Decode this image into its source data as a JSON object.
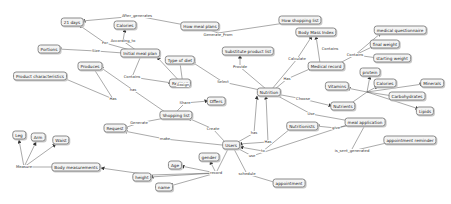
{
  "diagram": {
    "type": "concept-map",
    "nodes": [
      {
        "id": "21days",
        "label": "21 days",
        "x": 72,
        "y": 22
      },
      {
        "id": "howmeal",
        "label": "How meal plans",
        "x": 200,
        "y": 26
      },
      {
        "id": "howshop",
        "label": "How shopping list",
        "x": 300,
        "y": 20
      },
      {
        "id": "calories1",
        "label": "Calories",
        "x": 125,
        "y": 25
      },
      {
        "id": "portions",
        "label": "Portions",
        "x": 49,
        "y": 49
      },
      {
        "id": "initmeal",
        "label": "Initial meal plan",
        "x": 140,
        "y": 53
      },
      {
        "id": "subst",
        "label": "Substitute product list",
        "x": 248,
        "y": 51
      },
      {
        "id": "bmi",
        "label": "Body Mass Index",
        "x": 316,
        "y": 32
      },
      {
        "id": "medq",
        "label": "medical questionnaire",
        "x": 400,
        "y": 30
      },
      {
        "id": "finalw",
        "label": "final weight",
        "x": 385,
        "y": 44
      },
      {
        "id": "startw",
        "label": "starting weight",
        "x": 392,
        "y": 58
      },
      {
        "id": "medrec",
        "label": "Medical record",
        "x": 326,
        "y": 66
      },
      {
        "id": "typediet",
        "label": "Type of diet",
        "x": 180,
        "y": 60
      },
      {
        "id": "produces",
        "label": "Produces",
        "x": 90,
        "y": 66
      },
      {
        "id": "prodchar",
        "label": "Product characteristics",
        "x": 40,
        "y": 76
      },
      {
        "id": "recipes",
        "label": "Recipes",
        "x": 180,
        "y": 83
      },
      {
        "id": "nutrition",
        "label": "Nutrition",
        "x": 269,
        "y": 92
      },
      {
        "id": "protein",
        "label": "protein",
        "x": 370,
        "y": 72
      },
      {
        "id": "vitamins",
        "label": "Vitamins",
        "x": 337,
        "y": 86
      },
      {
        "id": "calories2",
        "label": "Calories",
        "x": 385,
        "y": 83
      },
      {
        "id": "minerals",
        "label": "Minerals",
        "x": 432,
        "y": 83
      },
      {
        "id": "carbs",
        "label": "Carbohydrates",
        "x": 407,
        "y": 96
      },
      {
        "id": "nutrients",
        "label": "Nutrients",
        "x": 343,
        "y": 106
      },
      {
        "id": "lipids",
        "label": "Lipids",
        "x": 425,
        "y": 111
      },
      {
        "id": "offers",
        "label": "Offers",
        "x": 216,
        "y": 101
      },
      {
        "id": "shoplist",
        "label": "Shopping list",
        "x": 176,
        "y": 115
      },
      {
        "id": "mealapp",
        "label": "meal application",
        "x": 365,
        "y": 122
      },
      {
        "id": "nutritionist",
        "label": "Nutritionists",
        "x": 302,
        "y": 126
      },
      {
        "id": "request",
        "label": "Request",
        "x": 115,
        "y": 128
      },
      {
        "id": "apptrem",
        "label": "appointment reminder",
        "x": 410,
        "y": 140
      },
      {
        "id": "users",
        "label": "Users",
        "x": 231,
        "y": 145
      },
      {
        "id": "leg",
        "label": "Leg",
        "x": 19,
        "y": 135
      },
      {
        "id": "arm",
        "label": "Arm",
        "x": 38,
        "y": 137
      },
      {
        "id": "waist",
        "label": "Waist",
        "x": 61,
        "y": 140
      },
      {
        "id": "gender",
        "label": "gender",
        "x": 209,
        "y": 157
      },
      {
        "id": "age",
        "label": "Age",
        "x": 175,
        "y": 165
      },
      {
        "id": "bodymeas",
        "label": "Body measurements",
        "x": 76,
        "y": 167
      },
      {
        "id": "height",
        "label": "height",
        "x": 142,
        "y": 177
      },
      {
        "id": "name",
        "label": "name",
        "x": 164,
        "y": 187
      },
      {
        "id": "appointment",
        "label": "appointment",
        "x": 289,
        "y": 183
      }
    ],
    "edge_labels": [
      {
        "text": "After_generates",
        "x": 137,
        "y": 16
      },
      {
        "text": "Generate_From",
        "x": 218,
        "y": 35
      },
      {
        "text": "For",
        "x": 105,
        "y": 43
      },
      {
        "text": "According_to",
        "x": 123,
        "y": 41
      },
      {
        "text": "Size",
        "x": 96,
        "y": 51
      },
      {
        "text": "Provide",
        "x": 240,
        "y": 67
      },
      {
        "text": "Calculate",
        "x": 297,
        "y": 59
      },
      {
        "text": "Contains",
        "x": 330,
        "y": 49
      },
      {
        "text": "Contains",
        "x": 355,
        "y": 55
      },
      {
        "text": "Has",
        "x": 287,
        "y": 79
      },
      {
        "text": "Select",
        "x": 223,
        "y": 82
      },
      {
        "text": "Assign",
        "x": 183,
        "y": 85
      },
      {
        "text": "Contains",
        "x": 132,
        "y": 77
      },
      {
        "text": "has",
        "x": 133,
        "y": 90
      },
      {
        "text": "Has",
        "x": 113,
        "y": 99
      },
      {
        "text": "Choose",
        "x": 303,
        "y": 99
      },
      {
        "text": "Share",
        "x": 185,
        "y": 103
      },
      {
        "text": "Use",
        "x": 311,
        "y": 114
      },
      {
        "text": "give",
        "x": 336,
        "y": 128
      },
      {
        "text": "Generate",
        "x": 139,
        "y": 123
      },
      {
        "text": "Create",
        "x": 213,
        "y": 129
      },
      {
        "text": "has",
        "x": 254,
        "y": 133
      },
      {
        "text": "Has",
        "x": 268,
        "y": 142
      },
      {
        "text": "to",
        "x": 263,
        "y": 151
      },
      {
        "text": "use",
        "x": 252,
        "y": 156
      },
      {
        "text": "make",
        "x": 165,
        "y": 139
      },
      {
        "text": "is_sent_generated",
        "x": 352,
        "y": 151
      },
      {
        "text": "schedule",
        "x": 247,
        "y": 174
      },
      {
        "text": "record",
        "x": 216,
        "y": 173
      },
      {
        "text": "Measure",
        "x": 24,
        "y": 167
      }
    ]
  },
  "colors": {
    "node_border": "#8a8a8a",
    "node_fill": "#f4f4f4",
    "edge": "#555555",
    "background": "#ffffff"
  }
}
